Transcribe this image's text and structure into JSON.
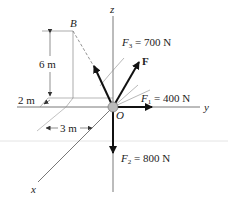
{
  "figure": {
    "axes": {
      "x": "x",
      "y": "y",
      "z": "z"
    },
    "origin_label": "O",
    "point_label": "B",
    "dimensions": {
      "height": "6 m",
      "x_offset": "2 m",
      "y_offset": "3 m"
    },
    "forces": {
      "F1": {
        "symbol": "F",
        "sub": "1",
        "value": "= 400 N"
      },
      "F2": {
        "symbol": "F",
        "sub": "2",
        "value": "= 800 N"
      },
      "F3": {
        "symbol": "F",
        "sub": "3",
        "value": "= 700 N"
      },
      "F": {
        "symbol": "F"
      }
    },
    "colors": {
      "line": "#222222",
      "light": "#888888",
      "origin_ball": "#bbbbbb"
    }
  }
}
